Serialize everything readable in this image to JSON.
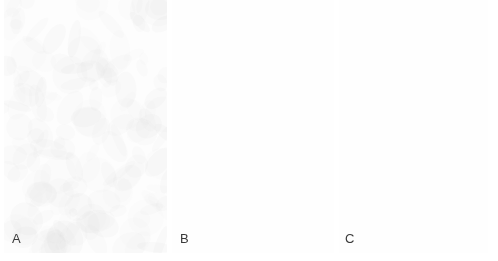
{
  "figure": {
    "type": "micrograph-figure",
    "background_color": "#ffffff",
    "width": 498,
    "height": 261,
    "panel_count": 3
  },
  "panels": [
    {
      "label": "A",
      "name": "panel-a",
      "x": 4,
      "y": 0,
      "width": 163,
      "height": 253,
      "description": "peripheral blood smear, dense red cell field with aggregated clumps",
      "background_color": "#fdfdfd",
      "rbc_color": "#c9c9c9",
      "rbc_pallor_color": "#eeeeee",
      "rbc_mean_diameter_px": 9,
      "rbc_count": 900,
      "density": "high",
      "clump_count": 14,
      "clump_color": "#b9b9b9",
      "dark_cells": [
        {
          "name": "nucleated-dark-cell",
          "x": 19,
          "y": 101,
          "rx": 8,
          "ry": 7,
          "color": "#2e2e2e"
        }
      ],
      "platelets": [
        {
          "x": 55,
          "y": 148,
          "r": 2,
          "color": "#4a4a4a"
        },
        {
          "x": 44,
          "y": 118,
          "r": 1.6,
          "color": "#555555"
        },
        {
          "x": 131,
          "y": 44,
          "r": 1.6,
          "color": "#5a5a5a"
        },
        {
          "x": 121,
          "y": 142,
          "r": 1.7,
          "color": "#4f4f4f"
        },
        {
          "x": 95,
          "y": 244,
          "r": 1.8,
          "color": "#4a4a4a"
        },
        {
          "x": 150,
          "y": 195,
          "r": 1.5,
          "color": "#5f5f5f"
        },
        {
          "x": 72,
          "y": 211,
          "r": 1.4,
          "color": "#606060"
        },
        {
          "x": 118,
          "y": 134,
          "r": 1.5,
          "color": "#585858"
        }
      ]
    },
    {
      "label": "B",
      "name": "panel-b",
      "x": 172,
      "y": 0,
      "width": 162,
      "height": 253,
      "description": "peripheral blood smear, evenly dispersed red cells with single dark lymphocyte",
      "background_color": "#fdfdfd",
      "rbc_color": "#cccccc",
      "rbc_pallor_color": "#f0f0f0",
      "rbc_mean_diameter_px": 10,
      "rbc_count": 640,
      "density": "medium",
      "clump_count": 3,
      "clump_color": "#bfbfbf",
      "dark_cells": [
        {
          "name": "dark-lymphocyte",
          "x": 24,
          "y": 63,
          "rx": 7,
          "ry": 6.5,
          "color": "#262626"
        }
      ],
      "platelets": [
        {
          "x": 47,
          "y": 45,
          "r": 2.0,
          "color": "#3f3f3f"
        },
        {
          "x": 43,
          "y": 50,
          "r": 1.5,
          "color": "#565656"
        },
        {
          "x": 72,
          "y": 48,
          "r": 1.7,
          "color": "#4c4c4c"
        },
        {
          "x": 60,
          "y": 150,
          "r": 1.6,
          "color": "#565656"
        },
        {
          "x": 54,
          "y": 170,
          "r": 1.9,
          "color": "#474747"
        },
        {
          "x": 1,
          "y": 156,
          "r": 1.5,
          "color": "#5a5a5a"
        },
        {
          "x": 112,
          "y": 193,
          "r": 1.5,
          "color": "#5c5c5c"
        },
        {
          "x": 105,
          "y": 62,
          "r": 1.4,
          "color": "#626262"
        }
      ]
    },
    {
      "label": "C",
      "name": "panel-c",
      "x": 339,
      "y": 0,
      "width": 149,
      "height": 253,
      "description": "high magnification blood smear, large red cells, one dark leukocyte and platelets",
      "background_color": "#fefefe",
      "rbc_color": "#cfcfcf",
      "rbc_pallor_color": "#f2f2f2",
      "rbc_mean_diameter_px": 25,
      "rbc_count": 70,
      "density": "low",
      "clump_count": 0,
      "clump_color": "#c4c4c4",
      "dark_cells": [
        {
          "name": "dark-leukocyte",
          "x": 99,
          "y": 88,
          "rx": 17,
          "ry": 16,
          "color": "#101010",
          "halo_color": "#e8e8e8"
        }
      ],
      "platelets": [
        {
          "x": 74,
          "y": 160,
          "r": 4.5,
          "color": "#3a3a3a"
        },
        {
          "x": 82,
          "y": 163,
          "r": 2.0,
          "color": "#5a5a5a"
        },
        {
          "x": 122,
          "y": 102,
          "r": 3.5,
          "color": "#404040"
        },
        {
          "x": 130,
          "y": 104,
          "r": 1.8,
          "color": "#5e5e5e"
        },
        {
          "x": 114,
          "y": 185,
          "r": 2.6,
          "color": "#3d3d3d"
        }
      ]
    }
  ],
  "labels": {
    "a": "A",
    "b": "B",
    "c": "C"
  }
}
